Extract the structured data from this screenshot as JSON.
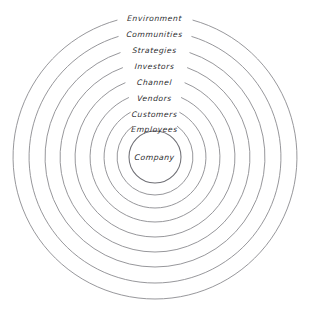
{
  "diagram": {
    "type": "concentric-rings",
    "title": "",
    "center": {
      "cx": 155,
      "cy": 157
    },
    "stroke_color": "#8b8b90",
    "text_color": "#2b2b2e",
    "background_color": "#ffffff",
    "rings": [
      {
        "label": "Environment",
        "level": 1,
        "radius": 142,
        "label_y": 14,
        "gap_half_deg": 15.5
      },
      {
        "label": "Communities",
        "level": 2,
        "radius": 126,
        "label_y": 30,
        "gap_half_deg": 17.0
      },
      {
        "label": "Strategies",
        "level": 3,
        "radius": 110,
        "label_y": 46,
        "gap_half_deg": 18.5
      },
      {
        "label": "Investors",
        "level": 4,
        "radius": 95,
        "label_y": 62,
        "gap_half_deg": 20.0
      },
      {
        "label": "Channel",
        "level": 5,
        "radius": 80,
        "label_y": 78,
        "gap_half_deg": 22.0
      },
      {
        "label": "Vendors",
        "level": 6,
        "radius": 65,
        "label_y": 94,
        "gap_half_deg": 24.0
      },
      {
        "label": "Customers",
        "level": 7,
        "radius": 51,
        "label_y": 110,
        "gap_half_deg": 29.0
      },
      {
        "label": "Employees",
        "level": 8,
        "radius": 38,
        "label_y": 125,
        "gap_half_deg": 36.0
      },
      {
        "label": "Company",
        "level": 9,
        "radius": 26,
        "label_y": 153,
        "gap_half_deg": 0.0
      }
    ]
  }
}
